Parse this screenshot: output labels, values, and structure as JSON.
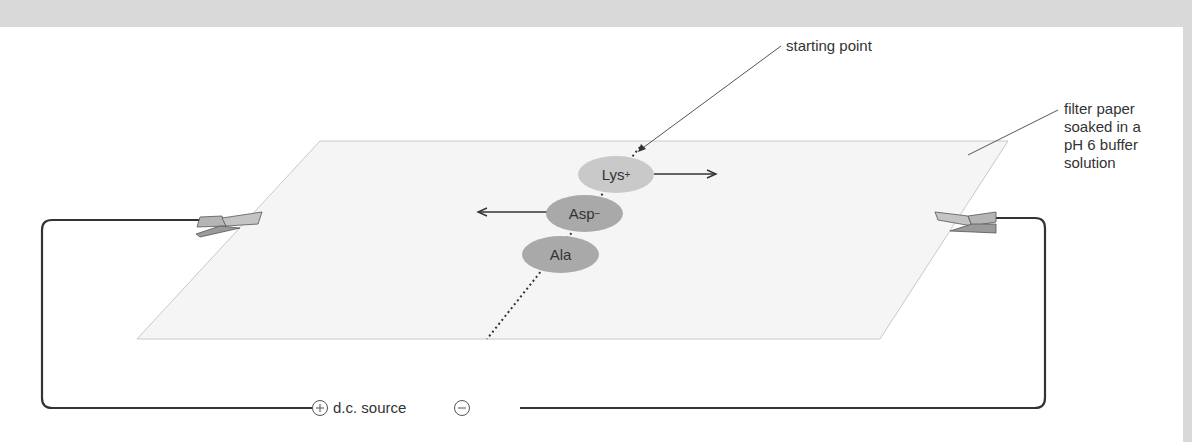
{
  "diagram": {
    "labels": {
      "starting_point": "starting point",
      "filter_paper": [
        "filter paper",
        "soaked in a",
        "pH 6 buffer",
        "solution"
      ],
      "dc_source": "d.c. source",
      "positive": "+",
      "negative": "−"
    },
    "spots": [
      {
        "name": "Lys",
        "charge": "+",
        "direction": "right",
        "color": "#c9c9c9"
      },
      {
        "name": "Asp",
        "charge": "−",
        "direction": "left",
        "color": "#a9a9a9"
      },
      {
        "name": "Ala",
        "charge": "",
        "direction": "none",
        "color": "#a9a9a9"
      }
    ],
    "colors": {
      "background_band": "#d9d9d9",
      "paper_fill": "#f4f4f4",
      "paper_edge": "#c8c8c8",
      "wire": "#333333"
    }
  }
}
